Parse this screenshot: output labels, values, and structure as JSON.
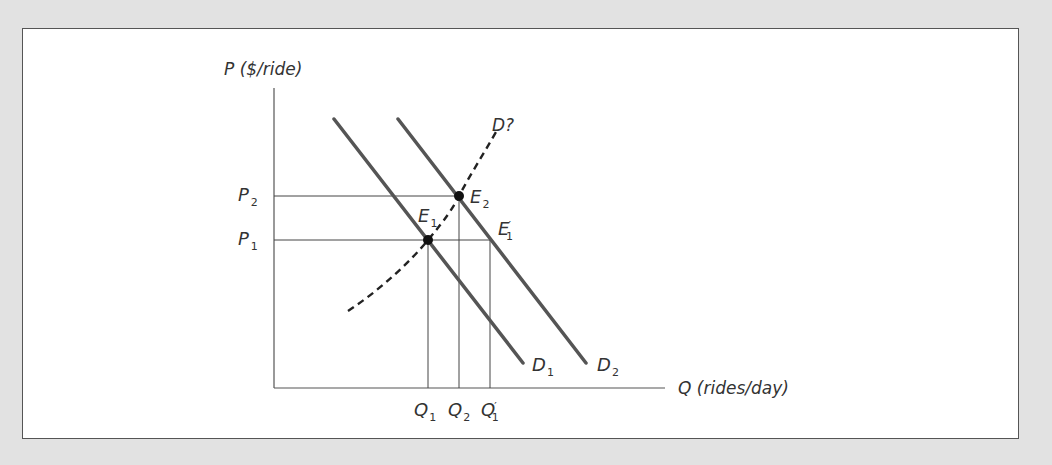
{
  "diagram": {
    "type": "supply-demand",
    "y_axis_label": "P ($/ride)",
    "x_axis_label": "Q (rides/day)",
    "price_labels": [
      {
        "main": "P",
        "sub": "2"
      },
      {
        "main": "P",
        "sub": "1"
      }
    ],
    "quantity_labels": [
      {
        "main": "Q",
        "sub": "1",
        "prime": ""
      },
      {
        "main": "Q",
        "sub": "2",
        "prime": ""
      },
      {
        "main": "Q",
        "sub": "1",
        "prime": "′"
      }
    ],
    "curves": [
      {
        "main": "D",
        "sub": "1",
        "style": "solid"
      },
      {
        "main": "D",
        "sub": "2",
        "style": "solid"
      },
      {
        "main": "D?",
        "sub": "",
        "style": "dashed"
      }
    ],
    "points": [
      {
        "main": "E",
        "sub": "1",
        "prime": ""
      },
      {
        "main": "E",
        "sub": "2",
        "prime": ""
      },
      {
        "main": "E",
        "sub": "1",
        "prime": "′"
      }
    ],
    "colors": {
      "background": "#e2e2e2",
      "panel": "#ffffff",
      "curve": "#555555",
      "text": "#333333"
    }
  }
}
